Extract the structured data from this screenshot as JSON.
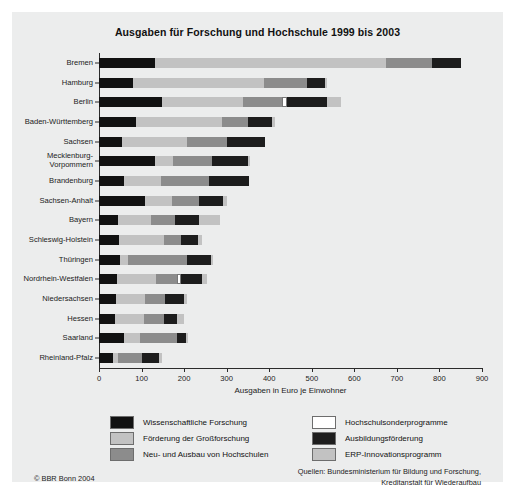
{
  "chart_data": {
    "type": "bar",
    "orientation": "horizontal",
    "stacked": true,
    "title": "Ausgaben für Forschung und Hochschule 1999 bis 2003",
    "xlabel": "Ausgaben in Euro je Einwohner",
    "ylabel": "",
    "xlim": [
      0,
      900
    ],
    "xticks": [
      0,
      100,
      200,
      300,
      400,
      500,
      600,
      700,
      800,
      900
    ],
    "grid": false,
    "legend_position": "bottom",
    "categories": [
      "Bremen",
      "Hamburg",
      "Berlin",
      "Baden-Württemberg",
      "Sachsen",
      "Mecklenburg-Vorpommern",
      "Brandenburg",
      "Sachsen-Anhalt",
      "Bayern",
      "Schleswig-Holstein",
      "Thüringen",
      "Nordrhein-Westfalen",
      "Niedersachsen",
      "Hessen",
      "Saarland",
      "Rheinland-Pfalz"
    ],
    "series": [
      {
        "name": "Wissenschaftliche Forschung",
        "color": "#111111",
        "values": [
          132,
          80,
          147,
          88,
          54,
          132,
          58,
          108,
          45,
          48,
          50,
          42,
          40,
          38,
          58,
          32
        ]
      },
      {
        "name": "Förderung der Großforschung",
        "color": "#c2c2c2",
        "values": [
          542,
          308,
          192,
          200,
          152,
          42,
          88,
          64,
          78,
          105,
          18,
          92,
          68,
          68,
          38,
          12
        ]
      },
      {
        "name": "Neu- und Ausbau von Hochschulen",
        "color": "#8c8c8c",
        "values": [
          108,
          100,
          90,
          62,
          96,
          92,
          112,
          62,
          56,
          40,
          140,
          50,
          46,
          46,
          88,
          58
        ]
      },
      {
        "name": "Hochschulsonderprogramme",
        "color": "#ffffff",
        "values": [
          0,
          0,
          12,
          0,
          0,
          0,
          0,
          0,
          0,
          0,
          0,
          8,
          0,
          0,
          0,
          0
        ]
      },
      {
        "name": "Ausbildungsförderung",
        "color": "#1d1d1d",
        "values": [
          68,
          42,
          96,
          56,
          88,
          84,
          95,
          58,
          56,
          40,
          55,
          50,
          46,
          32,
          20,
          38
        ]
      },
      {
        "name": "ERP-Innovationsprogramm",
        "color": "#c2c2c2",
        "values": [
          0,
          6,
          32,
          8,
          0,
          6,
          0,
          8,
          50,
          8,
          6,
          12,
          8,
          15,
          6,
          8
        ]
      }
    ],
    "totals": [
      850,
      536,
      569,
      414,
      390,
      356,
      353,
      300,
      285,
      241,
      269,
      254,
      208,
      199,
      210,
      148
    ]
  },
  "footer": {
    "credit": "© BBR Bonn 2004",
    "sources_line1": "Quellen: Bundesministerium für Bildung und Forschung,",
    "sources_line2": "Kreditanstalt für Wiederaufbau"
  }
}
